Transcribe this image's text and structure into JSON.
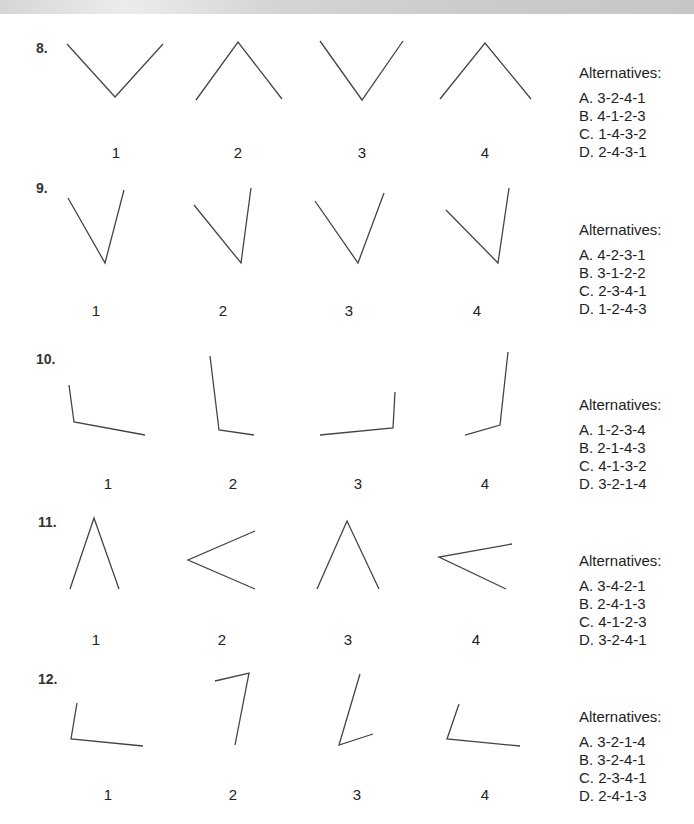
{
  "questions": [
    {
      "number": "8.",
      "top": 0,
      "figures": [
        {
          "label": "1",
          "points": "67,44 115,97 163,44",
          "label_x": 116
        },
        {
          "label": "2",
          "points": "196,100 238,42 282,99",
          "label_x": 238
        },
        {
          "label": "3",
          "points": "320,41 362,100 403,41",
          "label_x": 362
        },
        {
          "label": "4",
          "points": "440,99 485,43 531,99",
          "label_x": 485
        }
      ],
      "alternatives_title": "Alternatives:",
      "alternatives": [
        "A. 3-2-4-1",
        "B. 4-1-2-3",
        "C. 1-4-3-2",
        "D. 2-4-3-1"
      ]
    },
    {
      "number": "9.",
      "top": 160,
      "figures": [
        {
          "label": "1",
          "points": "68,198 105,263 124,190",
          "label_x": 96
        },
        {
          "label": "2",
          "points": "194,205 241,263 251,188",
          "label_x": 223
        },
        {
          "label": "3",
          "points": "315,201 358,263 384,193",
          "label_x": 349
        },
        {
          "label": "4",
          "points": "446,210 498,263 509,188",
          "label_x": 477
        }
      ],
      "alternatives_title": "Alternatives:",
      "alternatives": [
        "A. 4-2-3-1",
        "B. 3-1-2-2",
        "C. 2-3-4-1",
        "D. 1-2-4-3"
      ]
    },
    {
      "number": "10.",
      "top": 322,
      "figures": [
        {
          "label": "1",
          "points": "69,385 74,422 145,435",
          "label_x": 108
        },
        {
          "label": "2",
          "points": "210,356 219,430 254,435",
          "label_x": 233
        },
        {
          "label": "3",
          "points": "320,435 393,428 395,392",
          "label_x": 358
        },
        {
          "label": "4",
          "points": "465,435 500,425 508,352",
          "label_x": 485
        }
      ],
      "alternatives_title": "Alternatives:",
      "alternatives": [
        "A. 1-2-3-4",
        "B. 2-1-4-3",
        "C. 4-1-3-2",
        "D. 3-2-1-4"
      ]
    },
    {
      "number": "11.",
      "top": 484,
      "figures": [
        {
          "label": "1",
          "points": "70,589 94,518 119,589",
          "label_x": 96
        },
        {
          "label": "2",
          "points": "255,531 188,560 255,589",
          "label_x": 222
        },
        {
          "label": "3",
          "points": "317,589 347,521 379,589",
          "label_x": 348
        },
        {
          "label": "4",
          "points": "512,544 439,557 506,589",
          "label_x": 476
        }
      ],
      "alternatives_title": "Alternatives:",
      "alternatives": [
        "A. 3-4-2-1",
        "B. 2-4-1-3",
        "C. 4-1-2-3",
        "D. 3-2-4-1"
      ]
    },
    {
      "number": "12.",
      "top": 644,
      "figures": [
        {
          "label": "1",
          "points": "77,703 71,739 143,746",
          "label_x": 108
        },
        {
          "label": "2",
          "points": "215,681 249,673 235,745",
          "label_x": 233
        },
        {
          "label": "3",
          "points": "360,674 339,745 373,734",
          "label_x": 357
        },
        {
          "label": "4",
          "points": "459,704 447,739 520,746",
          "label_x": 485
        }
      ],
      "alternatives_title": "Alternatives:",
      "alternatives": [
        "A. 3-2-1-4",
        "B. 3-2-4-1",
        "C. 2-3-4-1",
        "D. 2-4-1-3"
      ]
    }
  ]
}
